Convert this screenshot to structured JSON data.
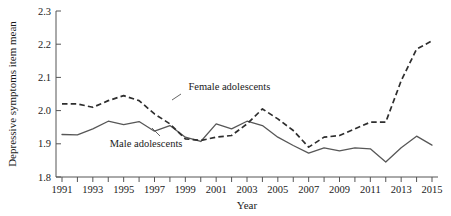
{
  "chart_data": {
    "type": "line",
    "title": "",
    "xlabel": "Year",
    "ylabel": "Depressive symptoms item mean",
    "xlim": [
      1991,
      2015
    ],
    "ylim": [
      1.8,
      2.3
    ],
    "yticks": [
      1.8,
      1.9,
      2.0,
      2.1,
      2.2,
      2.3
    ],
    "ytick_labels": [
      "1.8",
      "1.9",
      "2.0",
      "2.1",
      "2.2",
      "2.3"
    ],
    "xticks": [
      1991,
      1992,
      1993,
      1994,
      1995,
      1996,
      1997,
      1998,
      1999,
      2000,
      2001,
      2002,
      2003,
      2004,
      2005,
      2006,
      2007,
      2008,
      2009,
      2010,
      2011,
      2012,
      2013,
      2014,
      2015
    ],
    "xtick_labels": [
      "1991",
      "",
      "1993",
      "",
      "1995",
      "",
      "1997",
      "",
      "1999",
      "",
      "2001",
      "",
      "2003",
      "",
      "2005",
      "",
      "2007",
      "",
      "2009",
      "",
      "2011",
      "",
      "2013",
      "",
      "2015"
    ],
    "grid": false,
    "legend_position": "inline-annotation",
    "x": [
      1991,
      1992,
      1993,
      1994,
      1995,
      1996,
      1997,
      1998,
      1999,
      2000,
      2001,
      2002,
      2003,
      2004,
      2005,
      2006,
      2007,
      2008,
      2009,
      2010,
      2011,
      2012,
      2013,
      2014,
      2015
    ],
    "series": [
      {
        "name": "Female adolescents",
        "style": "dashed",
        "color": "#2e2e2e",
        "values": [
          2.02,
          2.02,
          2.01,
          2.03,
          2.045,
          2.03,
          1.99,
          1.96,
          1.915,
          1.91,
          1.92,
          1.925,
          1.96,
          2.005,
          1.975,
          1.94,
          1.89,
          1.92,
          1.925,
          1.945,
          1.965,
          1.965,
          2.09,
          2.185,
          2.21
        ]
      },
      {
        "name": "Male adolescents",
        "style": "solid",
        "color": "#575757",
        "values": [
          1.928,
          1.927,
          1.945,
          1.968,
          1.958,
          1.967,
          1.938,
          1.955,
          1.92,
          1.907,
          1.96,
          1.945,
          1.968,
          1.955,
          1.92,
          1.895,
          1.872,
          1.888,
          1.879,
          1.888,
          1.885,
          1.845,
          1.888,
          1.923,
          1.896
        ]
      }
    ],
    "annotations": [
      {
        "name": "female-adolescents-label",
        "text": "Female adolescents",
        "x": 1999.2,
        "y": 2.063
      },
      {
        "name": "male-adolescents-label",
        "text": "Male adolescents",
        "x": 1994.1,
        "y": 1.889
      }
    ]
  },
  "axes": {
    "x_title": "Year",
    "y_title": "Depressive symptoms item mean"
  },
  "colors": {
    "axis": "#555555",
    "female_series": "#2e2e2e",
    "male_series": "#575757",
    "background": "#ffffff",
    "text": "#1a1a1a"
  }
}
